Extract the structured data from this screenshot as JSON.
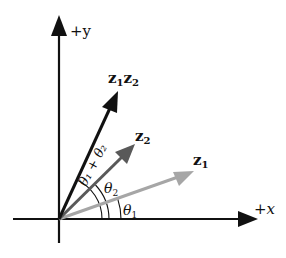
{
  "diagram": {
    "axes": {
      "x_label": "+x",
      "y_label": "+y"
    },
    "vectors": [
      {
        "name": "z1",
        "label_main": "z",
        "label_sub": "1",
        "color": "#a6a6a6"
      },
      {
        "name": "z2",
        "label_main": "z",
        "label_sub": "2",
        "color": "#595959"
      },
      {
        "name": "z1z2",
        "label_main1": "z",
        "label_sub1": "1",
        "label_main2": "z",
        "label_sub2": "2",
        "color": "#111111"
      }
    ],
    "angles": [
      {
        "name": "theta1",
        "symbol": "θ",
        "sub": "1"
      },
      {
        "name": "theta2",
        "symbol": "θ",
        "sub": "2"
      },
      {
        "name": "theta1-plus-theta2",
        "text": "θ₁ + θ₂"
      }
    ]
  }
}
